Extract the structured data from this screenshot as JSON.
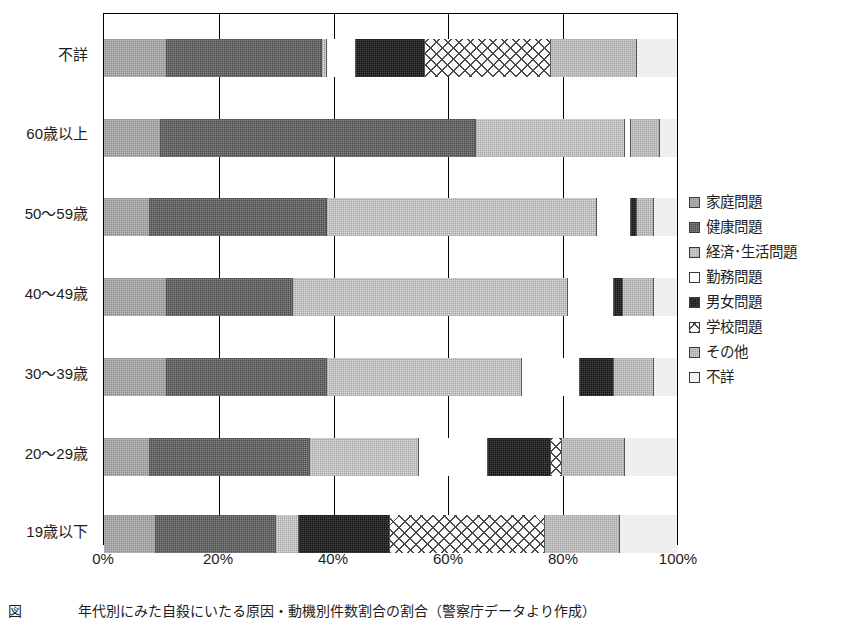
{
  "chart_data": {
    "type": "bar",
    "orientation": "horizontal",
    "stacked": true,
    "normalized": true,
    "title": "",
    "xlabel": "",
    "ylabel": "",
    "xlim": [
      0,
      100
    ],
    "xticks": [
      "0%",
      "20%",
      "40%",
      "60%",
      "80%",
      "100%"
    ],
    "xtick_values": [
      0,
      20,
      40,
      60,
      80,
      100
    ],
    "grid": true,
    "legend_position": "right",
    "categories": [
      "不詳",
      "60歳以上",
      "50～59歳",
      "40～49歳",
      "30～39歳",
      "20～29歳",
      "19歳以下"
    ],
    "series": [
      {
        "name": "家庭問題",
        "key": "katei",
        "pattern": "p-katei",
        "color": "#8e8e8e",
        "values": [
          11.0,
          10.0,
          8.0,
          11.0,
          11.0,
          8.0,
          9.0
        ]
      },
      {
        "name": "健康問題",
        "key": "kenko",
        "pattern": "p-kenko",
        "color": "#4a4a4a",
        "values": [
          27.0,
          55.0,
          31.0,
          22.0,
          28.0,
          28.0,
          21.0
        ]
      },
      {
        "name": "経済･生活問題",
        "key": "keizai",
        "pattern": "p-keizai",
        "color": "#dcdcdc",
        "values": [
          1.0,
          26.0,
          47.0,
          48.0,
          34.0,
          19.0,
          4.0
        ]
      },
      {
        "name": "勤務問題",
        "key": "kinmu",
        "pattern": "p-kinmu",
        "color": "#ffffff",
        "values": [
          5.0,
          1.0,
          6.0,
          8.0,
          10.0,
          12.0,
          0.0
        ]
      },
      {
        "name": "男女問題",
        "key": "danjo",
        "pattern": "p-danjo",
        "color": "#141414",
        "values": [
          12.0,
          0.0,
          1.0,
          1.5,
          6.0,
          11.0,
          16.0
        ]
      },
      {
        "name": "学校問題",
        "key": "gakko",
        "pattern": "p-gakko",
        "color": "#fbfbfb",
        "values": [
          22.0,
          0.0,
          0.0,
          0.0,
          0.0,
          2.0,
          27.0
        ]
      },
      {
        "name": "その他",
        "key": "sonota",
        "pattern": "p-sonota",
        "color": "#a6a6a6",
        "values": [
          15.0,
          5.0,
          3.0,
          5.5,
          7.0,
          11.0,
          13.0
        ]
      },
      {
        "name": "不詳",
        "key": "fusho",
        "pattern": "p-fusho",
        "color": "#efefef",
        "values": [
          7.0,
          3.0,
          4.0,
          4.0,
          4.0,
          9.0,
          10.0
        ]
      }
    ]
  },
  "legend": {
    "items": [
      {
        "label": "家庭問題"
      },
      {
        "label": "健康問題"
      },
      {
        "label": "経済･生活問題"
      },
      {
        "label": "勤務問題"
      },
      {
        "label": "男女問題"
      },
      {
        "label": "学校問題"
      },
      {
        "label": "その他"
      },
      {
        "label": "不詳"
      }
    ]
  },
  "caption": {
    "text": "図　　　　年代別にみた自殺にいたる原因・動機別件数割合の割合（警察庁データより作成）"
  }
}
